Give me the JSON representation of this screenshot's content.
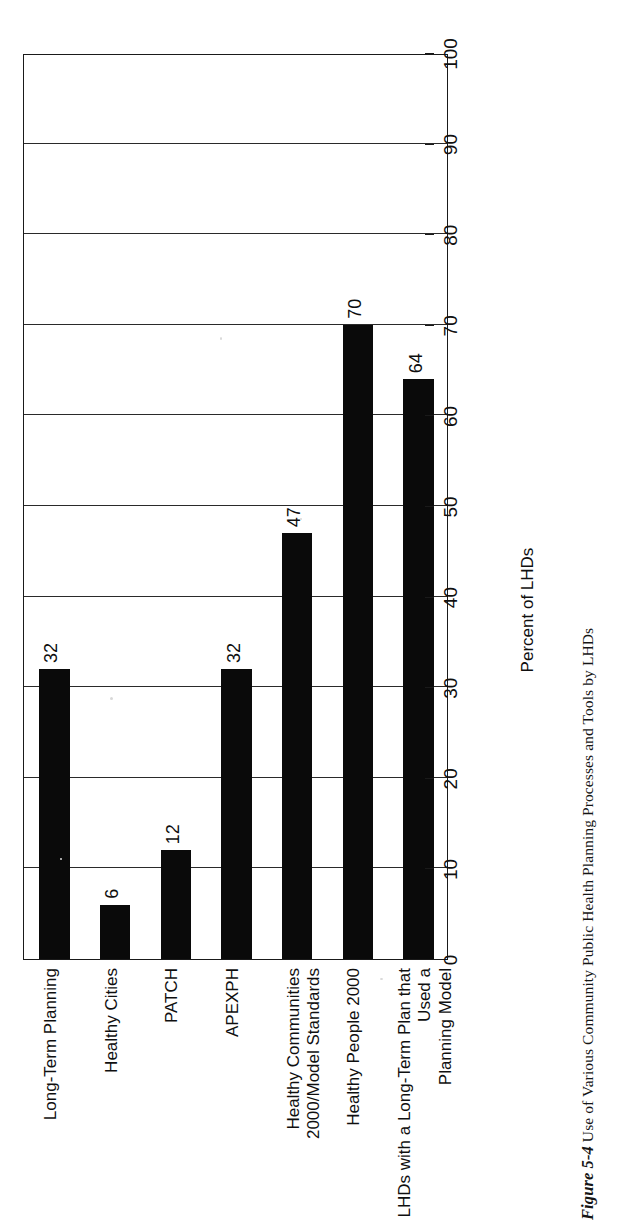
{
  "caption": {
    "figure_number": "Figure 5-4",
    "text": "Use of Various Community Public Health Planning Processes and Tools by LHDs"
  },
  "chart_data": {
    "type": "bar",
    "orientation": "vertical-printed-sideways",
    "title": "",
    "xlabel": "",
    "ylabel": "Percent of LHDs",
    "categories": [
      "Long-Term Planning",
      "Healthy Cities",
      "PATCH",
      "APEXPH",
      "Healthy Communities 2000/Model Standards",
      "Healthy People 2000",
      "LHDs with a Long-Term Plan that Used a\nPlanning Model"
    ],
    "values": [
      32,
      6,
      12,
      32,
      47,
      70,
      64
    ],
    "ylim": [
      0,
      100
    ],
    "ytick_step": 10,
    "yticks": [
      0,
      10,
      20,
      30,
      40,
      50,
      60,
      70,
      80,
      90,
      100
    ],
    "ytick_labels": [
      "0",
      "10",
      "20",
      "30",
      "40",
      "50",
      "60",
      "70",
      "80",
      "90",
      "100"
    ],
    "grid": true,
    "grid_axis": "value",
    "legend": false,
    "data_labels": true,
    "bar_color": "#0a0a0a",
    "frame_color": "#1a1a1a",
    "background": "#ffffff"
  }
}
